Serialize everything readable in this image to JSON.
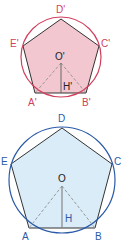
{
  "figures": [
    {
      "name": "small-pentagon",
      "stroke_color": "#d0405e",
      "fill_color": "#f2c7cf",
      "label_color": "#d0405e",
      "center_label_color": "#222222",
      "labels": {
        "D": "D'",
        "E": "E'",
        "C": "C'",
        "O": "O'",
        "H": "H'",
        "A": "A'",
        "B": "B'"
      }
    },
    {
      "name": "large-pentagon",
      "stroke_color": "#2a5aa8",
      "fill_color": "#d9ecf7",
      "label_color": "#2a5aa8",
      "labels": {
        "D": "D",
        "E": "E",
        "C": "C",
        "O": "O",
        "H": "H",
        "A": "A",
        "B": "B"
      }
    }
  ]
}
